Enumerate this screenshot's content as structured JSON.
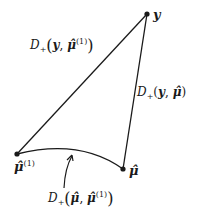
{
  "diagram": {
    "title": "",
    "nodes": [
      {
        "id": "y",
        "label": "y",
        "x": 147,
        "y": 14
      },
      {
        "id": "mu_hat_1",
        "label": "μ̂(1)",
        "x": 17,
        "y": 154
      },
      {
        "id": "mu_hat",
        "label": "μ̂",
        "x": 123,
        "y": 169
      }
    ],
    "edges": [
      {
        "from": "mu_hat_1",
        "to": "y",
        "shape": "straight",
        "label": "D+(y, μ̂(1))"
      },
      {
        "from": "mu_hat",
        "to": "y",
        "shape": "straight",
        "label": "D+(y, μ̂)"
      },
      {
        "from": "mu_hat_1",
        "to": "mu_hat",
        "shape": "curve",
        "label": "D+(μ̂, μ̂(1))"
      }
    ],
    "labels": {
      "node_y": "y",
      "node_mu_hat_1_base": "μ̂",
      "node_mu_hat_1_sup": "(1)",
      "node_mu_hat": "μ̂",
      "edge_y_mu1": {
        "D": "D",
        "sub": "+",
        "open": "(",
        "a": "y",
        "comma": ", ",
        "b": "μ̂",
        "b_sup": "(1)",
        "close": ")"
      },
      "edge_y_mu": {
        "D": "D",
        "sub": "+",
        "open": "(",
        "a": "y",
        "comma": ", ",
        "b": "μ̂",
        "close": ")"
      },
      "edge_mu_mu1": {
        "D": "D",
        "sub": "+",
        "open": "(",
        "a": "μ̂",
        "comma": ", ",
        "b": "μ̂",
        "b_sup": "(1)",
        "close": ")"
      }
    },
    "colors": {
      "stroke": "#1a1a1a",
      "background": "#ffffff"
    }
  }
}
